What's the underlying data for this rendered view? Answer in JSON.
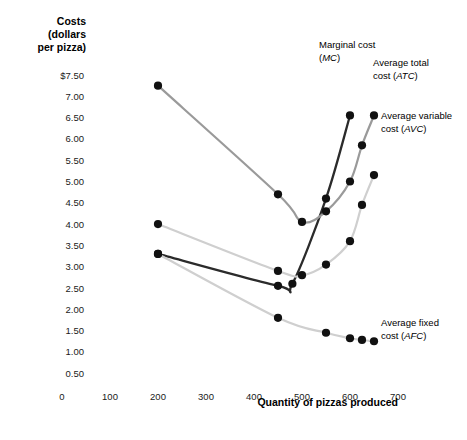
{
  "chart_data": {
    "type": "line",
    "title": "",
    "ylabel": "Costs (dollars per pizza)",
    "ylabel_lines": [
      "Costs",
      "(dollars",
      "per pizza)"
    ],
    "xlabel": "Quantity of pizzas produced",
    "xlim": [
      0,
      740
    ],
    "ylim": [
      0,
      7.8
    ],
    "grid": false,
    "legend_position": "inline-annotations",
    "y_ticks": [
      "$7.50",
      "7.00",
      "6.50",
      "6.00",
      "5.50",
      "5.00",
      "4.50",
      "4.00",
      "3.50",
      "3.00",
      "2.50",
      "2.00",
      "1.50",
      "1.00",
      "0.50"
    ],
    "y_tick_values": [
      7.5,
      7.0,
      6.5,
      6.0,
      5.5,
      5.0,
      4.5,
      4.0,
      3.5,
      3.0,
      2.5,
      2.0,
      1.5,
      1.0,
      0.5
    ],
    "x_ticks": [
      "0",
      "100",
      "200",
      "300",
      "400",
      "500",
      "600",
      "700"
    ],
    "x_tick_values": [
      0,
      100,
      200,
      300,
      400,
      500,
      600,
      700
    ],
    "series": [
      {
        "name": "Marginal cost (MC)",
        "key": "MC",
        "abbr": "MC",
        "label_line1": "Marginal cost",
        "label_line2_pre": "(",
        "label_line2_ital": "MC",
        "label_line2_post": ")",
        "color": "#2b2b2b",
        "x": [
          200,
          450,
          480,
          550,
          600
        ],
        "y": [
          3.3,
          2.55,
          2.6,
          4.6,
          6.55
        ]
      },
      {
        "name": "Average total cost (ATC)",
        "key": "ATC",
        "abbr": "ATC",
        "label_line1": "Average total",
        "label_line2_pre": "cost (",
        "label_line2_ital": "ATC",
        "label_line2_post": ")",
        "color": "#9a9a9a",
        "x": [
          200,
          450,
          500,
          550,
          600,
          625,
          650
        ],
        "y": [
          7.25,
          4.7,
          4.05,
          4.3,
          5.0,
          5.85,
          6.55
        ]
      },
      {
        "name": "Average variable cost (AVC)",
        "key": "AVC",
        "abbr": "AVC",
        "label_line1": "Average variable",
        "label_line2_pre": "cost (",
        "label_line2_ital": "AVC",
        "label_line2_post": ")",
        "color": "#cfcfcf",
        "x": [
          200,
          450,
          500,
          550,
          600,
          625,
          650
        ],
        "y": [
          4.0,
          2.9,
          2.8,
          3.05,
          3.6,
          4.45,
          5.15
        ]
      },
      {
        "name": "Average fixed cost (AFC)",
        "key": "AFC",
        "abbr": "AFC",
        "label_line1": "Average fixed",
        "label_line2_pre": "cost (",
        "label_line2_ital": "AFC",
        "label_line2_post": ")",
        "color": "#cfcfcf",
        "x": [
          200,
          450,
          550,
          600,
          625,
          650
        ],
        "y": [
          3.3,
          1.8,
          1.45,
          1.32,
          1.28,
          1.25
        ]
      }
    ]
  },
  "axes": {
    "y_title_lines": [
      "Costs",
      "(dollars",
      "per pizza)"
    ],
    "x_title": "Quantity of pizzas produced"
  },
  "colors": {
    "mc": "#2b2b2b",
    "atc": "#9a9a9a",
    "avc": "#cfcfcf",
    "afc": "#cfcfcf",
    "marker": "#111111",
    "background": "#ffffff"
  }
}
